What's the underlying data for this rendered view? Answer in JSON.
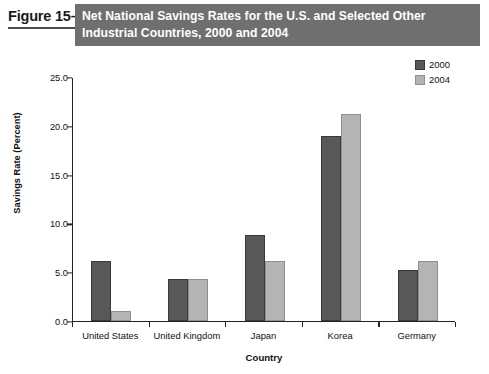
{
  "figure": {
    "number": "Figure 15–3",
    "title_lines": [
      "Net National Savings Rates for the U.S. and Selected Other",
      "Industrial Countries, 2000 and 2004"
    ],
    "band_color": "#6f6f6f"
  },
  "chart_data": {
    "type": "bar",
    "title": "Net National Savings Rates for the U.S. and Selected Other Industrial Countries, 2000 and 2004",
    "xlabel": "Country",
    "ylabel": "Savings Rate (Percent)",
    "categories": [
      "United States",
      "United Kingdom",
      "Japan",
      "Korea",
      "Germany"
    ],
    "series": [
      {
        "name": "2000",
        "color": "#585858",
        "values": [
          6.1,
          4.3,
          8.8,
          19.0,
          5.2
        ]
      },
      {
        "name": "2004",
        "color": "#b4b4b4",
        "values": [
          1.0,
          4.3,
          6.1,
          21.2,
          6.1
        ]
      }
    ],
    "ylim": [
      0.0,
      25.0
    ],
    "yticks": [
      "0.0",
      "5.0",
      "10.0",
      "15.0",
      "20.0",
      "25.0"
    ],
    "ytick_values": [
      0.0,
      5.0,
      10.0,
      15.0,
      20.0,
      25.0
    ],
    "grid": false,
    "legend_position": "top-right"
  }
}
